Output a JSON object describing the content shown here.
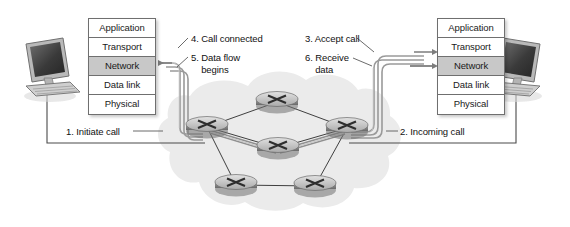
{
  "diagram": {
    "background_color": "#ffffff",
    "cloud_color": "#ebebeb",
    "highlight_color": "#c8c8c8",
    "line_color": "#4d4d4d",
    "pipe_color": "#9a9a9a"
  },
  "stacks": {
    "left": {
      "name": "sending-host-protocol-stack",
      "layers": [
        {
          "label": "Application",
          "highlighted": false
        },
        {
          "label": "Transport",
          "highlighted": false
        },
        {
          "label": "Network",
          "highlighted": true
        },
        {
          "label": "Data link",
          "highlighted": false
        },
        {
          "label": "Physical",
          "highlighted": false
        }
      ]
    },
    "right": {
      "name": "receiving-host-protocol-stack",
      "layers": [
        {
          "label": "Application",
          "highlighted": false
        },
        {
          "label": "Transport",
          "highlighted": false
        },
        {
          "label": "Network",
          "highlighted": true
        },
        {
          "label": "Data link",
          "highlighted": false
        },
        {
          "label": "Physical",
          "highlighted": false
        }
      ]
    }
  },
  "steps": [
    {
      "number": "1",
      "text": "1. Initiate call",
      "side": "left"
    },
    {
      "number": "2",
      "text": "2. Incoming call",
      "side": "right"
    },
    {
      "number": "3",
      "text": "3. Accept call",
      "side": "right"
    },
    {
      "number": "4",
      "text": "4. Call connected",
      "side": "left"
    },
    {
      "number": "5",
      "text": "5. Data flow\n    begins",
      "side": "left"
    },
    {
      "number": "6",
      "text": "6. Receive\n    data",
      "side": "right"
    }
  ],
  "devices": {
    "left_computer": {
      "label": "sending-host-computer"
    },
    "right_computer": {
      "label": "receiving-host-computer"
    }
  },
  "routers": [
    {
      "id": "r-top",
      "cx": 277,
      "cy": 102
    },
    {
      "id": "r-left",
      "cx": 207,
      "cy": 127
    },
    {
      "id": "r-right",
      "cx": 347,
      "cy": 128
    },
    {
      "id": "r-center",
      "cx": 278,
      "cy": 148
    },
    {
      "id": "r-bottom-left",
      "cx": 236,
      "cy": 185
    },
    {
      "id": "r-bottom-right",
      "cx": 315,
      "cy": 186
    }
  ],
  "links": [
    [
      "r-left",
      "r-top"
    ],
    [
      "r-top",
      "r-right"
    ],
    [
      "r-left",
      "r-center"
    ],
    [
      "r-center",
      "r-right"
    ],
    [
      "r-left",
      "r-bottom-left"
    ],
    [
      "r-bottom-left",
      "r-bottom-right"
    ],
    [
      "r-bottom-right",
      "r-right"
    ]
  ]
}
